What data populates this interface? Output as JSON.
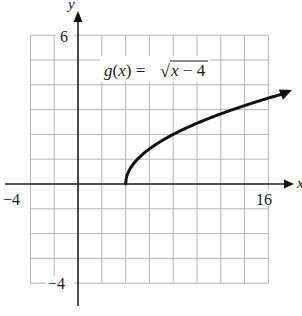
{
  "chart_data": {
    "type": "line",
    "title": "",
    "function_label": "g(x) = √(x − 4)",
    "xlabel": "x",
    "ylabel": "y",
    "xlim": [
      -4,
      16
    ],
    "ylim": [
      -4,
      6
    ],
    "x_grid_step": 2,
    "y_grid_step": 1,
    "grid": true,
    "tick_labels": {
      "x": [
        {
          "value": -4,
          "label": "−4"
        },
        {
          "value": 16,
          "label": "16"
        }
      ],
      "y": [
        {
          "value": 6,
          "label": "6"
        },
        {
          "value": -4,
          "label": "−4"
        }
      ]
    },
    "series": [
      {
        "name": "g(x) = sqrt(x - 4)",
        "start_point": [
          4,
          0
        ],
        "end_arrow": true,
        "x": [
          4,
          4.25,
          5,
          6,
          8,
          10,
          12,
          14,
          16,
          18
        ],
        "y": [
          0,
          0.5,
          1,
          1.41,
          2,
          2.45,
          2.83,
          3.16,
          3.46,
          3.74
        ]
      }
    ],
    "colors": {
      "curve": "#111111",
      "axes": "#222222",
      "grid": "#b5b5b5"
    }
  },
  "labels": {
    "x_axis": "x",
    "y_axis": "y",
    "x_min": "−4",
    "x_max": "16",
    "y_max": "6",
    "y_min": "−4",
    "func_prefix": "g(x) = ",
    "func_radicand": "x − 4"
  }
}
